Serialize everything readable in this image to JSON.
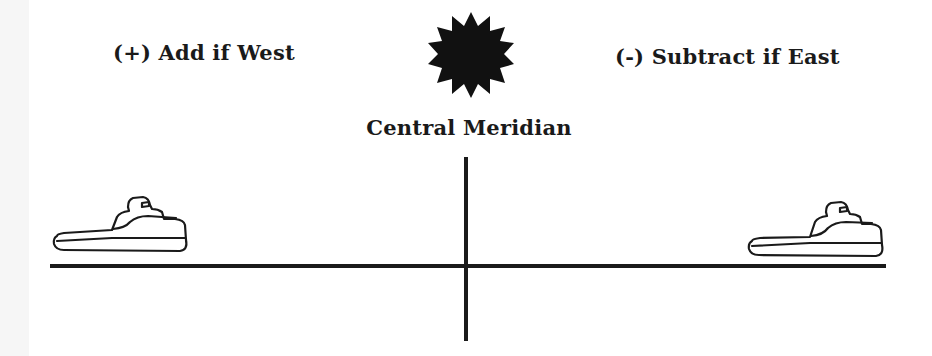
{
  "diagram": {
    "labels": {
      "west": "(+) Add if West",
      "east": "(-) Subtract if East",
      "meridian": "Central Meridian"
    },
    "icons": {
      "sun": "sun-burst-icon",
      "ship_west": "ship-icon",
      "ship_east": "ship-icon"
    },
    "colors": {
      "ink": "#1a1a1a",
      "background": "#ffffff",
      "margin_strip": "#f6f6f6"
    }
  }
}
